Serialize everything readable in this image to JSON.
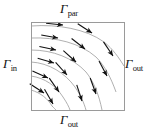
{
  "figure": {
    "kind": "boundary-condition-flow-diagram",
    "domain_box": {
      "x": 31,
      "y": 22,
      "width": 93,
      "height": 88,
      "stroke_color": "#9a9a9a",
      "stroke_width": 1
    },
    "labels": {
      "top": {
        "symbol": "Γ",
        "subscript": "par",
        "full": "Γpar"
      },
      "left": {
        "symbol": "Γ",
        "subscript": "in",
        "full": "Γin"
      },
      "right": {
        "symbol": "Γ",
        "subscript": "out",
        "full": "Γout"
      },
      "bottom": {
        "symbol": "Γ",
        "subscript": "out",
        "full": "Γout"
      }
    },
    "colors": {
      "streamline": "#9c9c9c",
      "arrow": "#111111",
      "border": "#9a9a9a",
      "background": "#ffffff",
      "text": "#111111"
    },
    "streamlines": {
      "count": 6,
      "description": "Curved flow lines entering the left edge horizontally, bending to the right and downward, exiting through the right and bottom edges.",
      "inlet_edge": "left",
      "outlet_edges": [
        "right",
        "bottom"
      ],
      "paths": [
        "M31,26 C58,24 86,29 104,42 C113,49 119,58 124,66",
        "M31,38 C56,37 80,43 96,57 C105,66 111,78 116,92",
        "M31,50 C53,50 73,58 86,72 C94,82 99,95 102,110",
        "M31,62 C49,63 65,73 75,87 C81,96 84,103 86,110",
        "M31,76 C45,78 56,86 63,97 C67,103 69,107 70,110",
        "M31,90 C41,93 48,99 52,106 C54,108 55,109 56,110"
      ],
      "arrows": [
        {
          "x": 63,
          "y": 25,
          "angle": 6
        },
        {
          "x": 92,
          "y": 33,
          "angle": 33
        },
        {
          "x": 113,
          "y": 56,
          "angle": 56
        },
        {
          "x": 58,
          "y": 38,
          "angle": 10
        },
        {
          "x": 85,
          "y": 49,
          "angle": 38
        },
        {
          "x": 107,
          "y": 76,
          "angle": 62
        },
        {
          "x": 56,
          "y": 50,
          "angle": 12
        },
        {
          "x": 76,
          "y": 62,
          "angle": 42
        },
        {
          "x": 96,
          "y": 94,
          "angle": 70
        },
        {
          "x": 54,
          "y": 63,
          "angle": 16
        },
        {
          "x": 67,
          "y": 75,
          "angle": 48
        },
        {
          "x": 82,
          "y": 101,
          "angle": 72
        },
        {
          "x": 48,
          "y": 78,
          "angle": 24
        },
        {
          "x": 59,
          "y": 92,
          "angle": 55
        },
        {
          "x": 44,
          "y": 93,
          "angle": 33
        },
        {
          "x": 53,
          "y": 104,
          "angle": 60
        }
      ]
    }
  }
}
